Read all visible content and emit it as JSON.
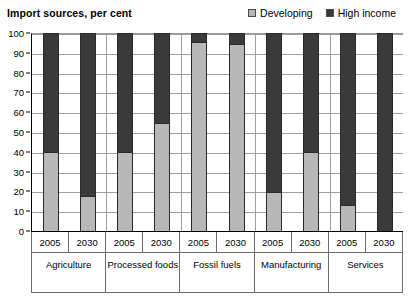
{
  "header": {
    "title": "Import sources, per cent"
  },
  "legend": {
    "position": "top-right",
    "entries": [
      {
        "label": "Developing",
        "color": "#b8b8b8",
        "icon": "square-swatch-icon"
      },
      {
        "label": "High income",
        "color": "#3a3a3a",
        "icon": "square-swatch-icon"
      }
    ]
  },
  "y_axis": {
    "ticks": [
      "100",
      "90",
      "80",
      "70",
      "60",
      "50",
      "40",
      "30",
      "20",
      "10",
      "0"
    ],
    "min": 0,
    "max": 100,
    "step": 10
  },
  "x_axis": {
    "year_cells": [
      "2005",
      "2030",
      "2005",
      "2030",
      "2005",
      "2030",
      "2005",
      "2030",
      "2005",
      "2030"
    ],
    "group_cells": [
      "Agriculture",
      "Processed foods",
      "Fossil fuels",
      "Manufacturing",
      "Services"
    ]
  },
  "chart_data": {
    "type": "bar",
    "subtype": "stacked-column-100",
    "title": "Import sources, per cent",
    "xlabel": "",
    "ylabel": "",
    "ylim": [
      0,
      100
    ],
    "ytick_step": 10,
    "grid": true,
    "legend_position": "top-right",
    "categories": [
      "Agriculture 2005",
      "Agriculture 2030",
      "Processed foods 2005",
      "Processed foods 2030",
      "Fossil fuels 2005",
      "Fossil fuels 2030",
      "Manufacturing 2005",
      "Manufacturing 2030",
      "Services 2005",
      "Services 2030"
    ],
    "groups": [
      {
        "name": "Agriculture",
        "years": [
          "2005",
          "2030"
        ]
      },
      {
        "name": "Processed foods",
        "years": [
          "2005",
          "2030"
        ]
      },
      {
        "name": "Fossil fuels",
        "years": [
          "2005",
          "2030"
        ]
      },
      {
        "name": "Manufacturing",
        "years": [
          "2005",
          "2030"
        ]
      },
      {
        "name": "Services",
        "years": [
          "2005",
          "2030"
        ]
      }
    ],
    "series": [
      {
        "name": "Developing",
        "color": "#b8b8b8",
        "values": [
          40,
          18,
          40,
          55,
          96,
          95,
          20,
          40,
          13,
          0
        ]
      },
      {
        "name": "High income",
        "color": "#3a3a3a",
        "values": [
          60,
          82,
          60,
          45,
          4,
          5,
          80,
          60,
          87,
          100
        ]
      }
    ]
  }
}
